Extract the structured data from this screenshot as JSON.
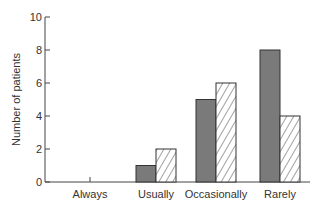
{
  "chart_data": {
    "type": "bar",
    "title": "",
    "xlabel": "",
    "ylabel": "Number of patients",
    "ylim": [
      0,
      10
    ],
    "yticks": [
      0,
      2,
      4,
      6,
      8,
      10
    ],
    "grid": false,
    "legend": null,
    "categories": [
      "Always",
      "Usually",
      "Occasionally",
      "Rarely"
    ],
    "series": [
      {
        "name": "Series 1 (solid grey)",
        "style": "solid",
        "color": "#7a7a7a",
        "values": [
          0,
          1,
          5,
          8
        ]
      },
      {
        "name": "Series 2 (hatched)",
        "style": "hatched",
        "color": "#ffffff",
        "values": [
          0,
          2,
          6,
          4
        ]
      }
    ]
  },
  "labels": {
    "ylabel": "Number of patients",
    "yticks": [
      "0",
      "2",
      "4",
      "6",
      "8",
      "10"
    ],
    "categories": [
      "Always",
      "Usually",
      "Occasionally",
      "Rarely"
    ]
  }
}
